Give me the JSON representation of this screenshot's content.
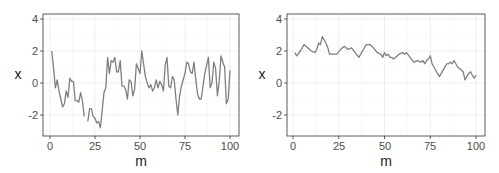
{
  "chart_data": [
    {
      "type": "line",
      "title": "",
      "xlabel": "m",
      "ylabel": "x",
      "xlim": [
        0,
        100
      ],
      "ylim": [
        -3.2,
        4.3
      ],
      "xticks": [
        0,
        25,
        50,
        75,
        100
      ],
      "yticks": [
        -2,
        0,
        2,
        4
      ],
      "grid": true,
      "line_color": "#7f7f7f",
      "series": [
        {
          "name": "x",
          "x": [
            1,
            2,
            3,
            4,
            5,
            6,
            7,
            8,
            9,
            10,
            11,
            12,
            13,
            14,
            15,
            16,
            17,
            18,
            19,
            20,
            21,
            22,
            23,
            24,
            25,
            26,
            27,
            28,
            29,
            30,
            31,
            32,
            33,
            34,
            35,
            36,
            37,
            38,
            39,
            40,
            41,
            42,
            43,
            44,
            45,
            46,
            47,
            48,
            49,
            50,
            51,
            52,
            53,
            54,
            55,
            56,
            57,
            58,
            59,
            60,
            61,
            62,
            63,
            64,
            65,
            66,
            67,
            68,
            69,
            70,
            71,
            72,
            73,
            74,
            75,
            76,
            77,
            78,
            79,
            80,
            81,
            82,
            83,
            84,
            85,
            86,
            87,
            88,
            89,
            90,
            91,
            92,
            93,
            94,
            95,
            96,
            97,
            98,
            99,
            100
          ],
          "values": [
            2.0,
            0.9,
            -0.3,
            0.2,
            -0.5,
            -1.0,
            -1.5,
            -1.3,
            -0.5,
            -0.9,
            0.3,
            0.1,
            0.1,
            -1.1,
            -1.1,
            -1.2,
            -0.6,
            -1.1,
            -2.1,
            null,
            -2.4,
            -1.6,
            -1.6,
            -2.1,
            -2.2,
            -2.5,
            -2.4,
            -2.8,
            -1.7,
            -0.6,
            -0.3,
            1.6,
            0.6,
            1.4,
            1.3,
            1.6,
            0.7,
            0.7,
            1.4,
            -0.2,
            -0.2,
            -0.4,
            -1.0,
            0.2,
            0.1,
            -0.8,
            -0.4,
            1.2,
            0.9,
            0.6,
            2.0,
            1.2,
            0.4,
            0.0,
            -0.3,
            -0.1,
            -0.5,
            -0.3,
            0.2,
            -0.3,
            0.1,
            -0.1,
            -0.5,
            1.1,
            1.6,
            -0.2,
            -0.3,
            0.4,
            0.2,
            -1.0,
            -2.0,
            -0.8,
            -0.2,
            0.2,
            0.6,
            1.3,
            1.2,
            0.7,
            0.6,
            1.3,
            0.2,
            -0.7,
            -1.0,
            -1.0,
            -0.2,
            0.6,
            1.1,
            1.6,
            -0.3,
            0.0,
            1.3,
            0.9,
            -0.8,
            0.1,
            1.7,
            1.3,
            1.0,
            -1.3,
            -1.0,
            0.8,
            0.2
          ]
        }
      ]
    },
    {
      "type": "line",
      "title": "",
      "xlabel": "m",
      "ylabel": "x",
      "xlim": [
        0,
        100
      ],
      "ylim": [
        -3.2,
        4.3
      ],
      "xticks": [
        0,
        25,
        50,
        75,
        100
      ],
      "yticks": [
        -2,
        0,
        2,
        4
      ],
      "grid": true,
      "line_color": "#7f7f7f",
      "series": [
        {
          "name": "x",
          "x": [
            1,
            2,
            4,
            6,
            8,
            10,
            12,
            13,
            14,
            15,
            16,
            18,
            19,
            20,
            22,
            24,
            26,
            28,
            29,
            30,
            32,
            34,
            36,
            38,
            40,
            42,
            44,
            46,
            48,
            49,
            50,
            51,
            52,
            53,
            54,
            55,
            56,
            58,
            60,
            61,
            62,
            64,
            66,
            68,
            70,
            71,
            72,
            73,
            74,
            75,
            76,
            78,
            80,
            82,
            84,
            85,
            86,
            87,
            88,
            90,
            92,
            93,
            94,
            96,
            97,
            98,
            99,
            100
          ],
          "values": [
            1.9,
            1.7,
            2.0,
            2.4,
            2.2,
            2.0,
            1.9,
            2.1,
            2.5,
            2.4,
            2.9,
            2.5,
            2.2,
            1.8,
            1.8,
            1.8,
            2.1,
            2.3,
            2.2,
            2.1,
            2.2,
            1.9,
            1.6,
            2.0,
            2.4,
            2.4,
            2.2,
            1.9,
            1.8,
            1.6,
            1.9,
            1.7,
            1.8,
            1.6,
            1.6,
            1.5,
            1.6,
            1.8,
            1.9,
            1.8,
            1.9,
            1.6,
            1.3,
            1.4,
            1.3,
            1.4,
            1.2,
            1.4,
            1.5,
            1.7,
            1.2,
            0.8,
            0.4,
            0.8,
            1.2,
            1.2,
            1.3,
            1.2,
            1.4,
            1.0,
            0.8,
            0.7,
            0.2,
            0.6,
            0.7,
            0.5,
            0.3,
            0.5
          ]
        }
      ]
    }
  ],
  "panels": [
    {
      "ylabel": "x",
      "xlabel": "m",
      "xtick_labels": [
        "0",
        "25",
        "50",
        "75",
        "100"
      ],
      "ytick_labels": [
        "4",
        "2",
        "0",
        "-2"
      ]
    },
    {
      "ylabel": "x",
      "xlabel": "m",
      "xtick_labels": [
        "0",
        "25",
        "50",
        "75",
        "100"
      ],
      "ytick_labels": [
        "4",
        "2",
        "0",
        "-2"
      ]
    }
  ]
}
